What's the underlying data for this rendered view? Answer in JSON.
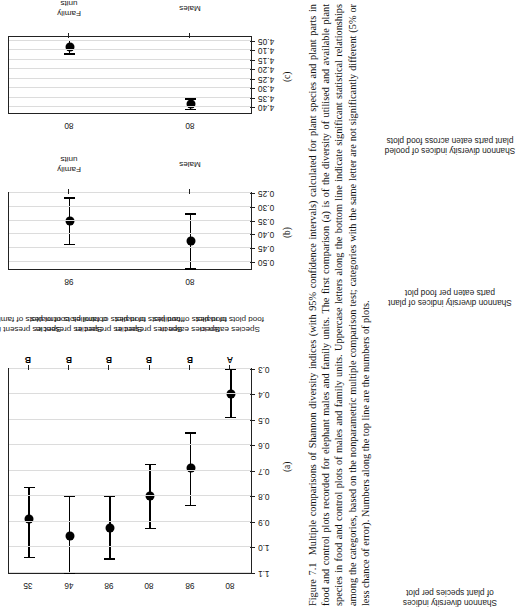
{
  "figure": {
    "number": "Figure 7.1",
    "caption": "Multiple comparisons of Shannon diversity indices (with 95% confidence intervals) calculated for plant species and plant parts in food and control plots recorded for elephant males and family units. The first comparison (a) is of the diversity of utilised and available plant species in food and control plots of males and family units. Uppercase letters along the bottom line indicate significant statistical relationships among the categories, based on the nonparametric multiple comparison test; categories with the same letter are not significantly different (5% or less chance of error). Numbers along the top line are the numbers of plots."
  },
  "panels": [
    {
      "tag": "(a)",
      "ylabel": "Shannon diversity indices\nof plant species per plot",
      "ylabel_lines": [
        "Shannon diversity indices",
        "of plant species per plot"
      ],
      "ylim": [
        0.3,
        1.1
      ],
      "yticks": [
        "0.3",
        "0.4",
        "0.5",
        "0.6",
        "0.7",
        "0.8",
        "0.9",
        "1.0",
        "1.1"
      ],
      "categories": [
        {
          "label": "Species eaten in\nfood plots of males",
          "label_lines": [
            "Species eaten in",
            "food plots of males"
          ],
          "n": "80",
          "letter": "A",
          "value": 0.4,
          "ci_low": 0.3,
          "ci_high": 0.49
        },
        {
          "label": "Species eaten in\nfood plots of families",
          "label_lines": [
            "Species eaten in",
            "food plots of families"
          ],
          "n": "98",
          "letter": "B",
          "value": 0.69,
          "ci_low": 0.55,
          "ci_high": 0.835
        },
        {
          "label": "Species present in\nfood plots of males",
          "label_lines": [
            "Species present in",
            "food plots of males"
          ],
          "n": "80",
          "letter": "B",
          "value": 0.8,
          "ci_low": 0.675,
          "ci_high": 0.925
        },
        {
          "label": "Species present in\nfood plots of families",
          "label_lines": [
            "Species present in",
            "food plots of families"
          ],
          "n": "98",
          "letter": "B",
          "value": 0.925,
          "ci_low": 0.8,
          "ci_high": 1.045
        },
        {
          "label": "Species present in\ncontrol plots of males",
          "label_lines": [
            "Species present in",
            "control plots of males"
          ],
          "n": "46",
          "letter": "B",
          "value": 0.955,
          "ci_low": 0.8,
          "ci_high": 1.1
        },
        {
          "label": "Species present in\ncontrol plots of families",
          "label_lines": [
            "Species present in",
            "control plots of families"
          ],
          "n": "35",
          "letter": "B",
          "value": 0.89,
          "ci_low": 0.765,
          "ci_high": 1.04
        }
      ]
    },
    {
      "tag": "(b)",
      "ylabel": "Shannon diversity indices of plant\nparts eaten per food plot",
      "ylabel_lines": [
        "Shannon diversity indices of plant",
        "parts eaten per food plot"
      ],
      "ylim": [
        0.25,
        0.525
      ],
      "yticks": [
        "0.25",
        "0.30",
        "0.35",
        "0.40",
        "0.45",
        "0.50"
      ],
      "categories": [
        {
          "label": "Males",
          "label_lines": [
            "Males"
          ],
          "n": "80",
          "letter": "",
          "value": 0.425,
          "ci_low": 0.325,
          "ci_high": 0.525
        },
        {
          "label": "Family\nunits",
          "label_lines": [
            "Family",
            "units"
          ],
          "n": "98",
          "letter": "",
          "value": 0.352,
          "ci_low": 0.268,
          "ci_high": 0.437
        }
      ]
    },
    {
      "tag": "(c)",
      "ylabel": "Shannon diversity indices of pooled\nplant parts eaten across food plots",
      "ylabel_lines": [
        "Shannon diversity indices of pooled",
        "plant parts eaten across food plots"
      ],
      "ylim": [
        4.03,
        4.43
      ],
      "yticks": [
        "4.05",
        "4.10",
        "4.15",
        "4.20",
        "4.25",
        "4.30",
        "4.35",
        "4.40"
      ],
      "categories": [
        {
          "label": "Males",
          "label_lines": [
            "Males"
          ],
          "n": "80",
          "letter": "",
          "value": 4.382,
          "ci_low": 4.355,
          "ci_high": 4.412
        },
        {
          "label": "Family\nunits",
          "label_lines": [
            "Family",
            "units"
          ],
          "n": "80",
          "letter": "",
          "value": 4.082,
          "ci_low": 4.048,
          "ci_high": 4.118
        }
      ]
    }
  ]
}
